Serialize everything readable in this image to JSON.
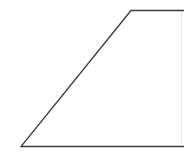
{
  "diagram": {
    "shape": "trapezoid",
    "stroke_color": "#3a3a3a",
    "right_edge_color": "#e6e6e6",
    "points": {
      "top_left": [
        131,
        10
      ],
      "top_right": [
        184,
        10
      ],
      "bottom_right": [
        184,
        146
      ],
      "bottom_left": [
        21,
        146
      ]
    }
  }
}
